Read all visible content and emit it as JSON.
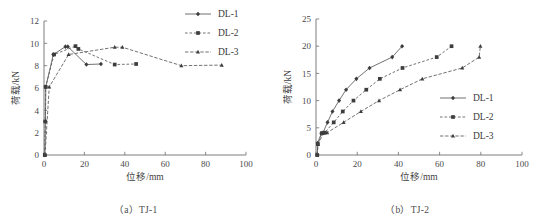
{
  "figure": {
    "panels": [
      {
        "caption": "（a）TJ-1",
        "xlabel": "位移/mm",
        "ylabel": "荷载/kN",
        "xticks": [
          "0",
          "20",
          "40",
          "60",
          "80",
          "100"
        ],
        "yticks": [
          "0",
          "2",
          "4",
          "6",
          "8",
          "10",
          "12"
        ],
        "legend": [
          "DL-1",
          "DL-2",
          "DL-3"
        ]
      },
      {
        "caption": "（b）TJ-2",
        "xlabel": "位移/mm",
        "ylabel": "荷载/kN",
        "xticks": [
          "0",
          "20",
          "40",
          "60",
          "80",
          "100"
        ],
        "yticks": [
          "0",
          "5",
          "10",
          "15",
          "20",
          "25"
        ],
        "legend": [
          "DL-1",
          "DL-2",
          "DL-3"
        ]
      }
    ]
  },
  "chart_data": [
    {
      "type": "line",
      "title": "（a）TJ-1",
      "xlabel": "位移/mm",
      "ylabel": "荷载/kN",
      "xlim": [
        0,
        100
      ],
      "ylim": [
        0,
        12
      ],
      "xticks": [
        0,
        20,
        40,
        60,
        80,
        100
      ],
      "yticks": [
        0,
        2,
        4,
        6,
        8,
        10,
        12
      ],
      "grid": false,
      "legend_position": "top-right-outside",
      "series": [
        {
          "name": "DL-1",
          "marker": "diamond",
          "linestyle": "solid",
          "points": [
            [
              0.4,
              0.0
            ],
            [
              0.7,
              3.0
            ],
            [
              0.9,
              6.1
            ],
            [
              4.6,
              9.0
            ],
            [
              10.6,
              9.7
            ],
            [
              11.8,
              9.7
            ],
            [
              21.0,
              8.1
            ],
            [
              28.2,
              8.15
            ]
          ]
        },
        {
          "name": "DL-2",
          "marker": "square",
          "linestyle": "dashed",
          "points": [
            [
              0.4,
              0.0
            ],
            [
              0.6,
              3.0
            ],
            [
              0.8,
              6.1
            ],
            [
              5.0,
              9.0
            ],
            [
              15.6,
              9.75
            ],
            [
              17.0,
              9.5
            ],
            [
              35.0,
              8.1
            ],
            [
              45.6,
              8.15
            ]
          ]
        },
        {
          "name": "DL-3",
          "marker": "triangle",
          "linestyle": "dashed",
          "points": [
            [
              0.5,
              0.0
            ],
            [
              2.6,
              6.1
            ],
            [
              12.2,
              9.0
            ],
            [
              35.0,
              9.65
            ],
            [
              38.8,
              9.65
            ],
            [
              68.0,
              8.0
            ],
            [
              88.0,
              8.05
            ]
          ]
        }
      ]
    },
    {
      "type": "line",
      "title": "（b）TJ-2",
      "xlabel": "位移/mm",
      "ylabel": "荷载/kN",
      "xlim": [
        0,
        100
      ],
      "ylim": [
        0,
        25
      ],
      "xticks": [
        0,
        20,
        40,
        60,
        80,
        100
      ],
      "yticks": [
        0,
        5,
        10,
        15,
        20,
        25
      ],
      "grid": false,
      "legend_position": "right-inside",
      "series": [
        {
          "name": "DL-1",
          "marker": "diamond",
          "linestyle": "solid",
          "points": [
            [
              0.6,
              0.0
            ],
            [
              0.8,
              2.2
            ],
            [
              2.6,
              4.0
            ],
            [
              3.4,
              4.1
            ],
            [
              5.6,
              6.0
            ],
            [
              8.0,
              8.0
            ],
            [
              11.2,
              10.0
            ],
            [
              14.6,
              12.0
            ],
            [
              19.6,
              14.0
            ],
            [
              26.0,
              16.0
            ],
            [
              37.0,
              18.0
            ],
            [
              41.8,
              20.0
            ]
          ]
        },
        {
          "name": "DL-2",
          "marker": "square",
          "linestyle": "dashed",
          "points": [
            [
              0.6,
              0.0
            ],
            [
              0.9,
              2.0
            ],
            [
              2.8,
              4.0
            ],
            [
              4.2,
              4.1
            ],
            [
              8.6,
              6.0
            ],
            [
              13.0,
              8.0
            ],
            [
              18.2,
              10.0
            ],
            [
              24.4,
              12.0
            ],
            [
              31.0,
              14.0
            ],
            [
              42.0,
              16.0
            ],
            [
              58.6,
              18.0
            ],
            [
              65.8,
              20.0
            ]
          ]
        },
        {
          "name": "DL-3",
          "marker": "triangle",
          "linestyle": "dashed",
          "points": [
            [
              0.6,
              0.0
            ],
            [
              1.0,
              2.0
            ],
            [
              3.6,
              4.0
            ],
            [
              5.4,
              4.1
            ],
            [
              13.4,
              6.0
            ],
            [
              21.8,
              8.0
            ],
            [
              30.6,
              10.0
            ],
            [
              40.8,
              12.0
            ],
            [
              51.6,
              14.0
            ],
            [
              71.0,
              16.0
            ],
            [
              79.2,
              18.0
            ],
            [
              79.8,
              20.0
            ]
          ]
        }
      ]
    }
  ]
}
